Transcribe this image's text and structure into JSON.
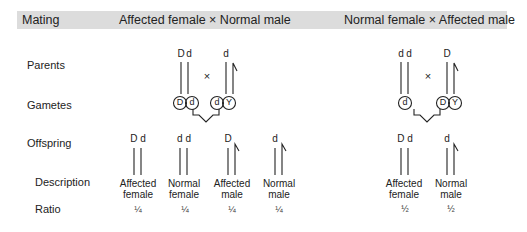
{
  "header": {
    "col0": "Mating",
    "col1": "Affected female × Normal male",
    "col2": "Normal female × Affected male"
  },
  "rows": {
    "parents": "Parents",
    "gametes": "Gametes",
    "offspring": "Offspring",
    "description": "Description",
    "ratio": "Ratio"
  },
  "cross1": {
    "times": "×",
    "mother_alleles": [
      "D",
      "d"
    ],
    "father_alleles": [
      "d"
    ],
    "gametes": [
      "D",
      "d",
      "d",
      "Y"
    ],
    "offspring": [
      {
        "alleles": "D d",
        "desc1": "Affected",
        "desc2": "female",
        "ratio": "¼"
      },
      {
        "alleles": "d d",
        "desc1": "Normal",
        "desc2": "female",
        "ratio": "¼"
      },
      {
        "alleles": "D",
        "desc1": "Affected",
        "desc2": "male",
        "ratio": "¼"
      },
      {
        "alleles": "d",
        "desc1": "Normal",
        "desc2": "male",
        "ratio": "¼"
      }
    ]
  },
  "cross2": {
    "times": "×",
    "mother_alleles": [
      "d",
      "d"
    ],
    "father_alleles": [
      "D"
    ],
    "gametes": [
      "d",
      "D",
      "Y"
    ],
    "offspring": [
      {
        "alleles": "D d",
        "desc1": "Affected",
        "desc2": "female",
        "ratio": "½"
      },
      {
        "alleles": "d",
        "desc1": "Normal",
        "desc2": "male",
        "ratio": "½"
      }
    ]
  }
}
